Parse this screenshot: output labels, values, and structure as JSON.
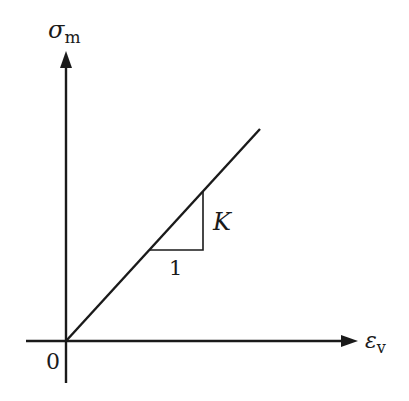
{
  "diagram": {
    "y_axis_label": {
      "main": "σ",
      "sub": "m"
    },
    "x_axis_label": {
      "main": "ε",
      "sub": "v"
    },
    "origin_label": "0",
    "slope_label": "K",
    "run_label": "1",
    "colors": {
      "line": "#1a1a1a",
      "background": "#ffffff"
    }
  }
}
